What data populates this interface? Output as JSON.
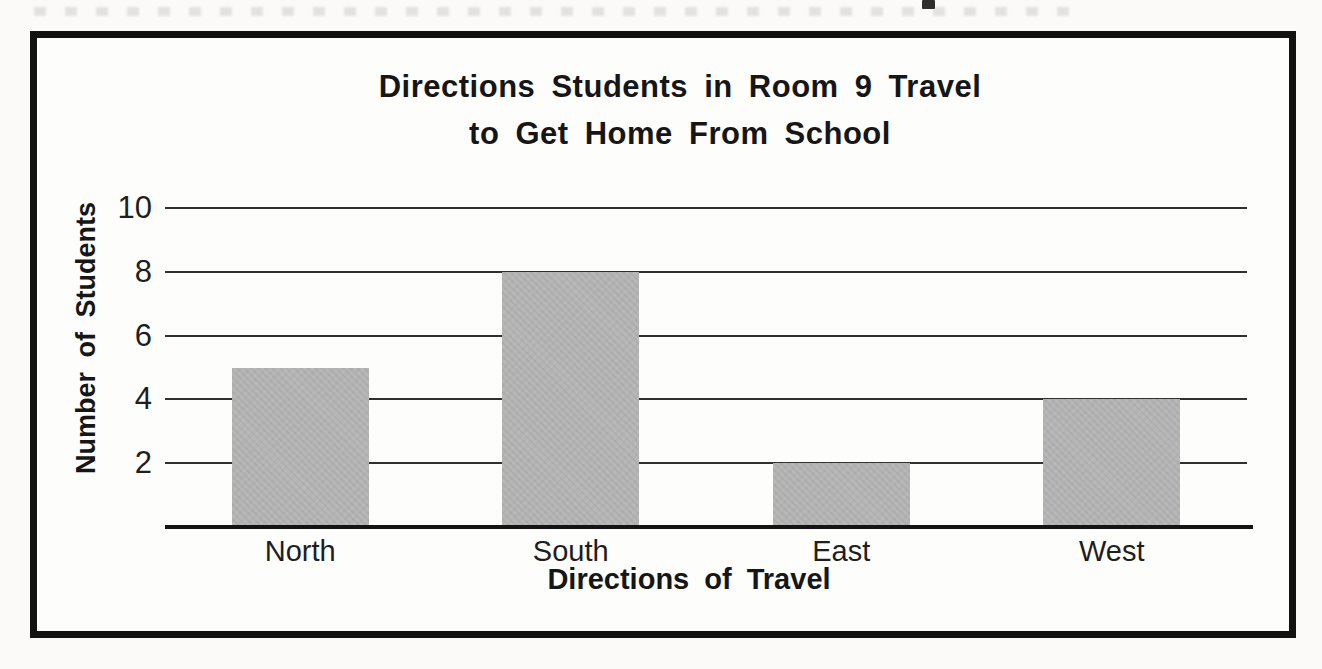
{
  "title": {
    "line1": "Directions Students in Room 9 Travel",
    "line2": "to Get Home From School"
  },
  "chart_data": {
    "type": "bar",
    "title": "Directions Students in Room 9 Travel to Get Home From School",
    "categories": [
      "North",
      "South",
      "East",
      "West"
    ],
    "values": [
      5,
      8,
      2,
      4
    ],
    "xlabel": "Directions of Travel",
    "ylabel": "Number of Students",
    "yticks": [
      2,
      4,
      6,
      8,
      10
    ],
    "ylim": [
      0,
      10
    ],
    "grid": true,
    "legend_position": "none",
    "bar_color": "#b4b4b4",
    "text_color": "#1a1a1a",
    "frame_color": "#121212"
  }
}
